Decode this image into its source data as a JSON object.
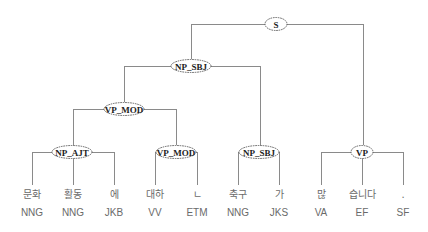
{
  "diagram": {
    "type": "parse-tree",
    "colors": {
      "edge": "#8a8a8a",
      "node_border": "#555555",
      "node_text": "#222222",
      "leaf_text": "#6a6a6a",
      "background": "#ffffff"
    },
    "nodes": [
      {
        "id": "s",
        "label": "S",
        "cx": 276,
        "cy": 24,
        "rx": 11,
        "ry": 6.5
      },
      {
        "id": "np_sbj_top",
        "label": "NP_SBJ",
        "cx": 191,
        "cy": 66,
        "rx": 20,
        "ry": 6.5
      },
      {
        "id": "vp_mod_top",
        "label": "VP_MOD",
        "cx": 124,
        "cy": 109,
        "rx": 20,
        "ry": 6.5
      },
      {
        "id": "np_ajt",
        "label": "NP_AJT",
        "cx": 72,
        "cy": 152,
        "rx": 20,
        "ry": 6.5
      },
      {
        "id": "vp_mod_low",
        "label": "VP_MOD",
        "cx": 176,
        "cy": 152,
        "rx": 20,
        "ry": 6.5
      },
      {
        "id": "np_sbj_low",
        "label": "NP_SBJ",
        "cx": 259,
        "cy": 152,
        "rx": 20,
        "ry": 6.5
      },
      {
        "id": "vp",
        "label": "VP",
        "cx": 362,
        "cy": 152,
        "rx": 11,
        "ry": 6.5
      }
    ],
    "leaves": [
      {
        "word": "문화",
        "pos": "NNG",
        "x": 32
      },
      {
        "word": "활동",
        "pos": "NNG",
        "x": 73
      },
      {
        "word": "에",
        "pos": "JKB",
        "x": 114
      },
      {
        "word": "대하",
        "pos": "VV",
        "x": 155
      },
      {
        "word": "ㄴ",
        "pos": "ETM",
        "x": 197
      },
      {
        "word": "축구",
        "pos": "NNG",
        "x": 238
      },
      {
        "word": "가",
        "pos": "JKS",
        "x": 279
      },
      {
        "word": "많",
        "pos": "VA",
        "x": 321
      },
      {
        "word": "습니다",
        "pos": "EF",
        "x": 362
      },
      {
        "word": ".",
        "pos": "SF",
        "x": 403
      }
    ],
    "edges": [
      {
        "parent": "s",
        "children_x": [
          191,
          363
        ],
        "child_y": [
          59,
          145
        ]
      },
      {
        "parent": "np_sbj_top",
        "children_x": [
          124,
          260
        ],
        "child_y": [
          102,
          145
        ]
      },
      {
        "parent": "vp_mod_top",
        "children_x": [
          73,
          176
        ],
        "child_y": [
          145,
          145
        ]
      },
      {
        "parent": "np_ajt",
        "children_x": [
          32,
          73,
          114
        ],
        "child_y": [
          185,
          185,
          185
        ]
      },
      {
        "parent": "vp_mod_low",
        "children_x": [
          155,
          197
        ],
        "child_y": [
          185,
          185
        ]
      },
      {
        "parent": "np_sbj_low",
        "children_x": [
          238,
          279
        ],
        "child_y": [
          185,
          185
        ]
      },
      {
        "parent": "vp",
        "children_x": [
          321,
          362,
          403
        ],
        "child_y": [
          185,
          185,
          185
        ]
      }
    ]
  }
}
